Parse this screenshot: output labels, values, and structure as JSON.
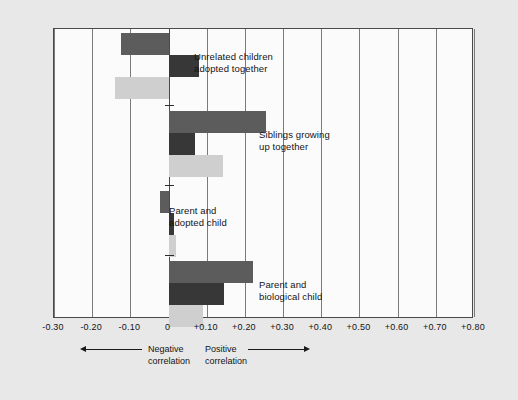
{
  "chart_data": {
    "type": "bar",
    "orientation": "horizontal",
    "title": "",
    "xlabel": "",
    "ylabel": "",
    "xlim": [
      -0.3,
      0.8
    ],
    "grid": true,
    "legend_position": "none",
    "zero_reference": 0,
    "tick_labels": [
      "-0.30",
      "-0.20",
      "-0.10",
      "0",
      "+0.10",
      "+0.20",
      "+0.30",
      "+0.40",
      "+0.50",
      "+0.60",
      "+0.70",
      "+0.80"
    ],
    "tick_values": [
      -0.3,
      -0.2,
      -0.1,
      0,
      0.1,
      0.2,
      0.3,
      0.4,
      0.5,
      0.6,
      0.7,
      0.8
    ],
    "categories": [
      "Unrelated children adopted together",
      "Siblings growing up together",
      "Parent and adopted child",
      "Parent and biological child"
    ],
    "series": [
      {
        "name": "series-1",
        "color": "#5c5c5c",
        "values": [
          -0.125,
          0.255,
          -0.022,
          0.22
        ]
      },
      {
        "name": "series-2",
        "color": "#373737",
        "values": [
          0.08,
          0.07,
          0.015,
          0.145
        ]
      },
      {
        "name": "series-3",
        "color": "#cfcfcf",
        "values": [
          -0.14,
          0.143,
          0.02,
          0.09
        ]
      }
    ],
    "annotations": [
      {
        "text_line1": "Unrelated children",
        "text_line2": "adopted together"
      },
      {
        "text_line1": "Siblings growing",
        "text_line2": "up together"
      },
      {
        "text_line1": "Parent and",
        "text_line2": "adopted child"
      },
      {
        "text_line1": "Parent and",
        "text_line2": "biological child"
      }
    ]
  },
  "axis_captions": {
    "negative_line1": "Negative",
    "negative_line2": "correlation",
    "positive_line1": "Positive",
    "positive_line2": "correlation"
  },
  "colors": {
    "page_background": "#e8e8e8",
    "plot_background": "#fbfbfb",
    "frame": "#4a4a4a",
    "gridline": "#7a7a7a",
    "text": "#141414"
  }
}
